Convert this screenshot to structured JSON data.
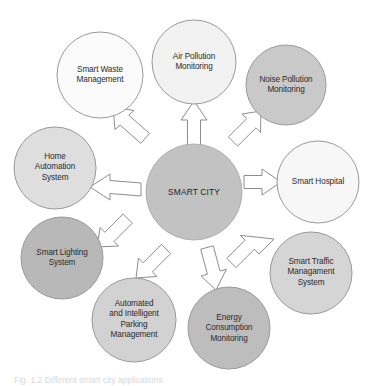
{
  "diagram": {
    "type": "hub-and-spoke",
    "hub": {
      "label": "SMART CITY",
      "cx": 194,
      "cy": 192,
      "r": 48,
      "fill": "#c2c2c2",
      "stroke": "#b0b0b0"
    },
    "nodes": [
      {
        "id": "air-pollution-monitoring",
        "label": "Air Pollution\nMonitoring",
        "cx": 194,
        "cy": 62,
        "r": 42,
        "angle": -90,
        "fill": "#f2f2f2",
        "stroke": "#9a9a9a"
      },
      {
        "id": "noise-pollution-monitoring",
        "label": "Noise Pollution\nMonitoring",
        "cx": 286,
        "cy": 85,
        "r": 40,
        "angle": -45,
        "fill": "#c9c9c9",
        "stroke": "#9a9a9a"
      },
      {
        "id": "smart-hospital",
        "label": "Smart Hospital",
        "cx": 318,
        "cy": 182,
        "r": 41,
        "angle": 0,
        "fill": "#f7f7f7",
        "stroke": "#9a9a9a"
      },
      {
        "id": "smart-traffic-management-system",
        "label": "Smart Traffic\nManagament\nSystem",
        "cx": 311,
        "cy": 273,
        "r": 41,
        "angle": 45,
        "fill": "#d5d5d5",
        "stroke": "#9a9a9a"
      },
      {
        "id": "energy-consumption-monitoring",
        "label": "Energy\nConsumption\nMonitoring",
        "cx": 229,
        "cy": 328,
        "r": 41,
        "angle": 90,
        "fill": "#bdbdbd",
        "stroke": "#9a9a9a"
      },
      {
        "id": "automated-intelligent-parking-management",
        "label": "Automated\nand Intelligent\nParking\nManagement",
        "cx": 134,
        "cy": 320,
        "r": 42,
        "angle": 135,
        "fill": "#d2d2d2",
        "stroke": "#9a9a9a"
      },
      {
        "id": "smart-lighting-system",
        "label": "Smart Lighting\nSystem",
        "cx": 62,
        "cy": 258,
        "r": 41,
        "angle": 180,
        "fill": "#b8b8b8",
        "stroke": "#9a9a9a"
      },
      {
        "id": "home-automation-system",
        "label": "Home\nAutomation\nSystem",
        "cx": 55,
        "cy": 168,
        "r": 41,
        "angle": 200,
        "fill": "#dedede",
        "stroke": "#9a9a9a"
      },
      {
        "id": "smart-waste-management",
        "label": "Smart Waste\nManagement",
        "cx": 100,
        "cy": 75,
        "r": 43,
        "angle": 240,
        "fill": "#fbfbfb",
        "stroke": "#9a9a9a"
      }
    ],
    "arrows": {
      "fill": "#ffffff",
      "stroke": "#8d8d8d",
      "style": "block-arrow"
    }
  },
  "caption": {
    "text": "Fig. 1.2  Different smart city applications"
  }
}
